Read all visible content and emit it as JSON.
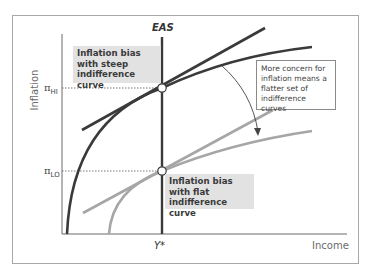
{
  "axes": {
    "y_label": "Inflation",
    "x_label": "Income",
    "y_ticks": [
      {
        "symbol": "π",
        "sub": "HI"
      },
      {
        "symbol": "π",
        "sub": "LO"
      }
    ],
    "x_ticks": [
      "Y*"
    ]
  },
  "curves": {
    "eas_label": "EAS"
  },
  "labels": {
    "bias_steep": "Inflation bias with steep indifference curve",
    "bias_flat": "Inflation bias with flat indifference curve",
    "note": "More concern for inflation means a flatter set of indifference curves"
  },
  "colors": {
    "dark_curve": "#3a3a3a",
    "light_curve": "#a6a6a6",
    "label_bg": "#e2e2e2",
    "frame": "#a8a8a8"
  }
}
